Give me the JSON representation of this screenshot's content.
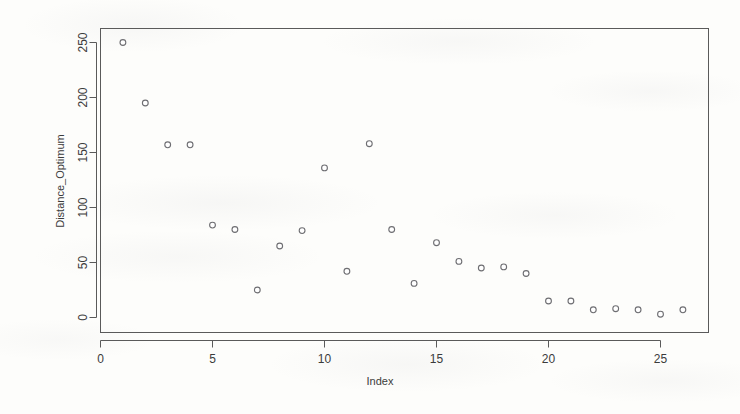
{
  "chart_data": {
    "type": "scatter",
    "title": "",
    "xlabel": "Index",
    "ylabel": "Distance_Optimum",
    "xlim": [
      0,
      27
    ],
    "ylim": [
      -8,
      262
    ],
    "xticks": [
      0,
      5,
      10,
      15,
      20,
      25
    ],
    "yticks": [
      0,
      50,
      100,
      150,
      200,
      250
    ],
    "xtick_labels": [
      "0",
      "5",
      "10",
      "15",
      "20",
      "25"
    ],
    "ytick_labels": [
      "0",
      "50",
      "100",
      "150",
      "200",
      "250"
    ],
    "grid": false,
    "legend": null,
    "marker": "open-circle",
    "marker_color": "#6e6e72",
    "x": [
      1,
      2,
      3,
      4,
      5,
      6,
      7,
      8,
      9,
      10,
      11,
      12,
      13,
      14,
      15,
      16,
      17,
      18,
      19,
      20,
      21,
      22,
      23,
      24,
      25,
      26
    ],
    "values": [
      250,
      195,
      157,
      157,
      84,
      80,
      25,
      65,
      79,
      136,
      42,
      158,
      80,
      31,
      68,
      51,
      45,
      46,
      40,
      15,
      15,
      7,
      8,
      7,
      3,
      7
    ],
    "points": [
      {
        "x": 1,
        "y": 250
      },
      {
        "x": 2,
        "y": 195
      },
      {
        "x": 3,
        "y": 157
      },
      {
        "x": 4,
        "y": 157
      },
      {
        "x": 5,
        "y": 84
      },
      {
        "x": 6,
        "y": 80
      },
      {
        "x": 7,
        "y": 25
      },
      {
        "x": 8,
        "y": 65
      },
      {
        "x": 9,
        "y": 79
      },
      {
        "x": 10,
        "y": 136
      },
      {
        "x": 11,
        "y": 42
      },
      {
        "x": 12,
        "y": 158
      },
      {
        "x": 13,
        "y": 80
      },
      {
        "x": 14,
        "y": 31
      },
      {
        "x": 15,
        "y": 68
      },
      {
        "x": 16,
        "y": 51
      },
      {
        "x": 17,
        "y": 45
      },
      {
        "x": 18,
        "y": 46
      },
      {
        "x": 19,
        "y": 40
      },
      {
        "x": 20,
        "y": 15
      },
      {
        "x": 21,
        "y": 15
      },
      {
        "x": 22,
        "y": 7
      },
      {
        "x": 23,
        "y": 8
      },
      {
        "x": 24,
        "y": 7
      },
      {
        "x": 25,
        "y": 3
      },
      {
        "x": 26,
        "y": 7
      }
    ]
  },
  "colors": {
    "background": "#fdfdfb",
    "axis": "#5a5a5a",
    "text": "#3b3b3b",
    "marker_stroke": "#6e6e72",
    "marker_fill": "#ffffff"
  }
}
